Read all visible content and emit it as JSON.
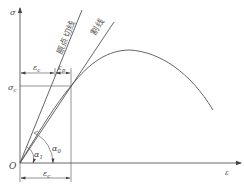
{
  "diagram": {
    "type": "stress-strain curve",
    "axes": {
      "y_label": "σ",
      "x_label": "ε",
      "origin_label": "O"
    },
    "lines": {
      "tangent_label": "原点切线",
      "secant_label": "割线"
    },
    "annotations": {
      "sigma_c": {
        "main": "σ",
        "sub": "c"
      },
      "epsilon_c_top": {
        "main": "ε",
        "sub": "c"
      },
      "epsilon_p": {
        "main": "ε",
        "sub": "p"
      },
      "epsilon_c_bottom": {
        "main": "ε",
        "sub": "c"
      },
      "alpha_1": {
        "main": "α",
        "sub": "1"
      },
      "alpha_0": {
        "main": "α",
        "sub": "0"
      }
    },
    "colors": {
      "line": "#555555",
      "text": "#444444"
    }
  }
}
